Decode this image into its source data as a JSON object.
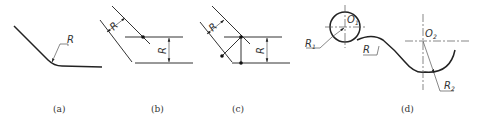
{
  "figure": {
    "panels": [
      {
        "id": "a",
        "caption": "(a)",
        "labels": {
          "radius": "R"
        }
      },
      {
        "id": "b",
        "caption": "(b)",
        "labels": {
          "radius_offset_slant": "R",
          "radius_offset_horizontal": "R"
        }
      },
      {
        "id": "c",
        "caption": "(c)",
        "labels": {
          "radius_offset_slant": "R",
          "radius_offset_horizontal": "R"
        }
      },
      {
        "id": "d",
        "caption": "(d)",
        "labels": {
          "center1": "O",
          "center1_sub": "1",
          "center2": "O",
          "center2_sub": "2",
          "radius1": "R",
          "radius1_sub": "1",
          "radius2": "R",
          "radius2_sub": "2",
          "radius_connect": "R"
        }
      }
    ]
  }
}
